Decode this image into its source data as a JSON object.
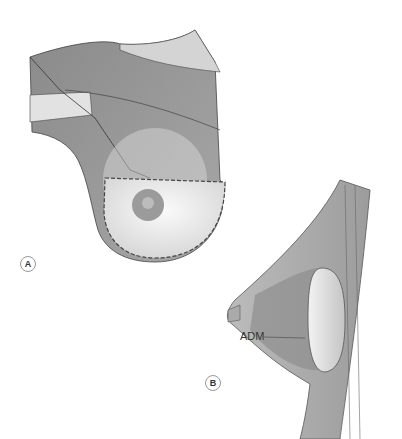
{
  "figure": {
    "panels": [
      {
        "label": "A",
        "description": "Anterior view of chest with pectoralis muscle and sutured skin-sparing flap around nipple"
      },
      {
        "label": "B",
        "description": "Sagittal cross-section of breast with implant and acellular dermal matrix"
      }
    ],
    "annotations": [
      {
        "text": "ADM",
        "panel": "B"
      }
    ]
  }
}
